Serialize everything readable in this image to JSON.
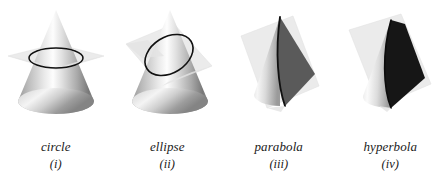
{
  "figure": {
    "background_color": "#ffffff",
    "width": 446,
    "height": 186
  },
  "colors": {
    "plane": "#ebebeb",
    "plane_edge": "#dddddd",
    "cone_light": "#ffffff",
    "cone_mid": "#c9c9c9",
    "cone_dark": "#7a7a7a",
    "curve_stroke": "#111111",
    "parabola_fill": "#5a5a5a",
    "hyperbola_fill": "#161616",
    "caption_text": "#1a1a1a"
  },
  "panels": [
    {
      "id": "circle",
      "name": "circle",
      "numeral": "(i)",
      "section_type": "circle",
      "plane_orientation": "horizontal, perpendicular to cone axis",
      "curve_style": "outline",
      "curve_fill": "none"
    },
    {
      "id": "ellipse",
      "name": "ellipse",
      "numeral": "(ii)",
      "section_type": "ellipse",
      "plane_orientation": "oblique, tilted but cutting all generators",
      "curve_style": "outline",
      "curve_fill": "none"
    },
    {
      "id": "parabola",
      "name": "parabola",
      "numeral": "(iii)",
      "section_type": "parabola",
      "plane_orientation": "parallel to one generator of the cone",
      "curve_style": "filled",
      "curve_fill": "#5a5a5a"
    },
    {
      "id": "hyperbola",
      "name": "hyperbola",
      "numeral": "(iv)",
      "section_type": "hyperbola",
      "plane_orientation": "parallel to the cone axis",
      "curve_style": "filled",
      "curve_fill": "#161616"
    }
  ]
}
